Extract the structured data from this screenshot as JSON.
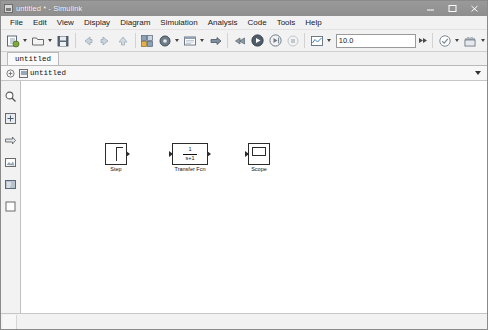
{
  "window": {
    "title": "untitled * - Simulink",
    "icon": "simulink-icon",
    "controls": [
      {
        "name": "minimize-button",
        "glyph": "minimize"
      },
      {
        "name": "maximize-button",
        "glyph": "maximize"
      },
      {
        "name": "close-button",
        "glyph": "close"
      }
    ]
  },
  "menubar": {
    "items": [
      {
        "label": "File"
      },
      {
        "label": "Edit"
      },
      {
        "label": "View"
      },
      {
        "label": "Display"
      },
      {
        "label": "Diagram"
      },
      {
        "label": "Simulation"
      },
      {
        "label": "Analysis"
      },
      {
        "label": "Code"
      },
      {
        "label": "Tools"
      },
      {
        "label": "Help"
      }
    ]
  },
  "toolbar": {
    "new_model_icon": "new-model-icon",
    "open_icon": "open-folder-icon",
    "save_icon": "save-icon",
    "back_icon": "back-arrow-icon",
    "forward_icon": "forward-arrow-icon",
    "up_icon": "up-arrow-icon",
    "library_browser_icon": "library-browser-icon",
    "model_config_icon": "model-configuration-icon",
    "model_explorer_icon": "model-explorer-icon",
    "update_model_icon": "update-model-icon",
    "fast_restart_icon": "fast-restart-icon",
    "run_icon": "run-icon",
    "step_forward_icon": "step-forward-icon",
    "stop_icon": "stop-icon",
    "simulation_data_inspector_icon": "simulation-data-inspector-icon",
    "sim_time_value": "10.0",
    "sim_time_placeholder": "10.0",
    "fast_forward_icon": "fast-forward-icon",
    "model_advisor_icon": "model-advisor-icon",
    "build_icon": "build-model-icon"
  },
  "tabs": [
    {
      "label": "untitled",
      "active": true
    }
  ],
  "breadcrumb": {
    "expand_icon": "expand-tree-icon",
    "model_icon": "model-icon",
    "path": "untitled",
    "dropdown_icon": "chevron-down-icon"
  },
  "palette": {
    "items": [
      {
        "name": "zoom-icon",
        "label": "Zoom"
      },
      {
        "name": "fit-to-view-icon",
        "label": "Fit to view"
      },
      {
        "name": "navigate-icon",
        "label": "Navigate"
      },
      {
        "name": "image-icon",
        "label": "Image"
      },
      {
        "name": "legend-icon",
        "label": "Legend"
      },
      {
        "name": "area-icon",
        "label": "Area"
      }
    ]
  },
  "canvas": {
    "blocks": [
      {
        "id": "step",
        "type": "Step",
        "label": "Step",
        "x": 105,
        "y": 143,
        "width": 22,
        "height": 22,
        "ports": {
          "in": 0,
          "out": 1
        }
      },
      {
        "id": "transfer-fcn",
        "type": "Transfer Fcn",
        "label": "Transfer Fcn",
        "numerator": "1",
        "denominator": "s+1",
        "x": 172,
        "y": 143,
        "width": 36,
        "height": 22,
        "ports": {
          "in": 1,
          "out": 1
        }
      },
      {
        "id": "scope",
        "type": "Scope",
        "label": "Scope",
        "x": 248,
        "y": 143,
        "width": 22,
        "height": 22,
        "ports": {
          "in": 1,
          "out": 0
        }
      }
    ]
  },
  "statusbar": {
    "text": ""
  }
}
